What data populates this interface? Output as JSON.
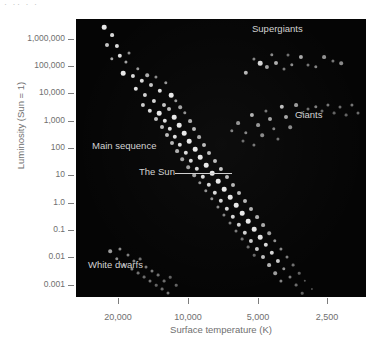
{
  "figure": {
    "top_fragment": "·  ·· ·  ·",
    "background_color": "#ffffff",
    "panel_color": "#050505",
    "star_color": "#e8e8e8",
    "axis_text_color": "#6f6f6f",
    "annotation_text_color": "#d2d2d2"
  },
  "chart_data": {
    "type": "scatter",
    "title": "",
    "xlabel": "Surface temperature (K)",
    "ylabel": "Luminosity (Sun = 1)",
    "grid": false,
    "legend_position": "in-plot annotations",
    "x_scale": "log-reversed",
    "y_scale": "log",
    "xlim": [
      26000,
      2100
    ],
    "ylim": [
      0.0002,
      2000000
    ],
    "xticks": [
      {
        "value": 20000,
        "label": "20,000",
        "px": 118
      },
      {
        "value": 10000,
        "label": "10,000",
        "px": 188
      },
      {
        "value": 5000,
        "label": "5,000",
        "px": 258
      },
      {
        "value": 2500,
        "label": "2,500",
        "px": 327
      }
    ],
    "yticks": [
      {
        "value": 1000000,
        "label": "1,000,000",
        "px": 20
      },
      {
        "value": 100000,
        "label": "100,000",
        "px": 47
      },
      {
        "value": 10000,
        "label": "10,000",
        "px": 74
      },
      {
        "value": 1000,
        "label": "1,000",
        "px": 102
      },
      {
        "value": 100,
        "label": "100",
        "px": 129
      },
      {
        "value": 10,
        "label": "10",
        "px": 156
      },
      {
        "value": 1.0,
        "label": "1.0",
        "px": 184
      },
      {
        "value": 0.1,
        "label": "0.1",
        "px": 211
      },
      {
        "value": 0.01,
        "label": "0.01",
        "px": 238
      },
      {
        "value": 0.001,
        "label": "0.001",
        "px": 266
      }
    ],
    "annotations": [
      {
        "name": "supergiants",
        "text": "Supergiants"
      },
      {
        "name": "giants",
        "text": "Giants"
      },
      {
        "name": "main-sequence",
        "text": "Main sequence"
      },
      {
        "name": "the-sun",
        "text": "The Sun",
        "has_leader_line": true
      },
      {
        "name": "white-dwarfs",
        "text": "White dwarfs"
      }
    ],
    "series": [
      {
        "name": "Main sequence",
        "points": [
          [
            28,
            8,
            4.6,
            1.0
          ],
          [
            36,
            16,
            3.8,
            0.92
          ],
          [
            31,
            26,
            4.0,
            0.85
          ],
          [
            41,
            27,
            4.2,
            0.95
          ],
          [
            44,
            37,
            4.4,
            0.96
          ],
          [
            36,
            40,
            3.4,
            0.72
          ],
          [
            50,
            43,
            3.2,
            0.7
          ],
          [
            53,
            34,
            3.0,
            0.62
          ],
          [
            47,
            54,
            4.6,
            1.0
          ],
          [
            57,
            57,
            4.2,
            0.93
          ],
          [
            62,
            50,
            3.4,
            0.66
          ],
          [
            66,
            62,
            4.4,
            0.95
          ],
          [
            71,
            56,
            3.6,
            0.74
          ],
          [
            60,
            70,
            4.4,
            0.97
          ],
          [
            75,
            66,
            4.0,
            0.85
          ],
          [
            80,
            58,
            3.2,
            0.6
          ],
          [
            69,
            76,
            4.2,
            0.9
          ],
          [
            84,
            72,
            4.4,
            0.97
          ],
          [
            90,
            64,
            3.4,
            0.64
          ],
          [
            78,
            82,
            4.2,
            0.92
          ],
          [
            95,
            76,
            4.6,
            1.0
          ],
          [
            88,
            86,
            4.0,
            0.84
          ],
          [
            100,
            82,
            3.4,
            0.66
          ],
          [
            67,
            86,
            4.2,
            0.88
          ],
          [
            74,
            92,
            4.4,
            0.95
          ],
          [
            83,
            94,
            4.6,
            1.0
          ],
          [
            93,
            90,
            4.0,
            0.8
          ],
          [
            104,
            88,
            3.6,
            0.7
          ],
          [
            98,
            98,
            4.6,
            1.0
          ],
          [
            89,
            102,
            4.4,
            0.96
          ],
          [
            80,
            100,
            4.0,
            0.82
          ],
          [
            109,
            94,
            3.4,
            0.62
          ],
          [
            103,
            106,
            4.6,
            1.0
          ],
          [
            94,
            110,
            4.4,
            0.95
          ],
          [
            86,
            108,
            4.0,
            0.8
          ],
          [
            114,
            102,
            3.8,
            0.74
          ],
          [
            108,
            114,
            4.6,
            1.0
          ],
          [
            99,
            118,
            4.4,
            0.96
          ],
          [
            118,
            110,
            4.0,
            0.8
          ],
          [
            91,
            116,
            4.0,
            0.8
          ],
          [
            113,
            122,
            4.6,
            1.0
          ],
          [
            104,
            126,
            4.4,
            0.95
          ],
          [
            123,
            118,
            3.8,
            0.72
          ],
          [
            96,
            124,
            4.0,
            0.78
          ],
          [
            119,
            130,
            4.6,
            1.0
          ],
          [
            110,
            134,
            4.4,
            0.94
          ],
          [
            128,
            126,
            4.0,
            0.8
          ],
          [
            101,
            132,
            3.8,
            0.74
          ],
          [
            124,
            138,
            4.6,
            1.0
          ],
          [
            115,
            142,
            4.4,
            0.94
          ],
          [
            133,
            134,
            4.0,
            0.8
          ],
          [
            106,
            140,
            3.6,
            0.7
          ],
          [
            130,
            146,
            4.6,
            1.0
          ],
          [
            121,
            150,
            4.4,
            0.93
          ],
          [
            139,
            142,
            4.0,
            0.8
          ],
          [
            112,
            148,
            3.6,
            0.68
          ],
          [
            136,
            154,
            4.6,
            1.0
          ],
          [
            127,
            158,
            4.4,
            0.94
          ],
          [
            145,
            150,
            4.2,
            0.86
          ],
          [
            118,
            156,
            3.6,
            0.7
          ],
          [
            142,
            162,
            4.6,
            1.0
          ],
          [
            133,
            166,
            4.4,
            0.93
          ],
          [
            151,
            158,
            4.0,
            0.8
          ],
          [
            124,
            164,
            3.4,
            0.64
          ],
          [
            148,
            170,
            4.6,
            1.0
          ],
          [
            139,
            174,
            4.4,
            0.94
          ],
          [
            157,
            166,
            4.0,
            0.78
          ],
          [
            130,
            172,
            3.4,
            0.62
          ],
          [
            154,
            178,
            4.6,
            1.0
          ],
          [
            145,
            182,
            4.4,
            0.92
          ],
          [
            163,
            174,
            4.0,
            0.8
          ],
          [
            136,
            180,
            3.4,
            0.62
          ],
          [
            160,
            186,
            4.6,
            1.0
          ],
          [
            151,
            190,
            4.4,
            0.92
          ],
          [
            169,
            182,
            4.0,
            0.78
          ],
          [
            142,
            188,
            3.2,
            0.58
          ],
          [
            166,
            194,
            4.6,
            1.0
          ],
          [
            157,
            198,
            4.4,
            0.92
          ],
          [
            175,
            190,
            4.0,
            0.76
          ],
          [
            148,
            196,
            3.2,
            0.56
          ],
          [
            172,
            202,
            4.6,
            1.0
          ],
          [
            163,
            206,
            4.4,
            0.9
          ],
          [
            181,
            198,
            3.8,
            0.74
          ],
          [
            154,
            204,
            3.0,
            0.54
          ],
          [
            178,
            210,
            4.6,
            0.98
          ],
          [
            169,
            214,
            4.4,
            0.9
          ],
          [
            187,
            206,
            3.8,
            0.72
          ],
          [
            160,
            212,
            3.0,
            0.52
          ],
          [
            184,
            218,
            4.6,
            0.98
          ],
          [
            175,
            222,
            4.2,
            0.88
          ],
          [
            193,
            214,
            3.6,
            0.68
          ],
          [
            166,
            220,
            2.8,
            0.48
          ],
          [
            190,
            226,
            4.4,
            0.94
          ],
          [
            181,
            230,
            4.2,
            0.86
          ],
          [
            199,
            222,
            3.4,
            0.62
          ],
          [
            172,
            228,
            2.8,
            0.46
          ],
          [
            196,
            234,
            4.4,
            0.92
          ],
          [
            187,
            238,
            4.0,
            0.82
          ],
          [
            205,
            230,
            3.2,
            0.58
          ],
          [
            178,
            236,
            2.6,
            0.44
          ],
          [
            202,
            242,
            4.2,
            0.88
          ],
          [
            193,
            246,
            3.8,
            0.76
          ],
          [
            211,
            238,
            3.0,
            0.54
          ],
          [
            199,
            254,
            3.6,
            0.68
          ],
          [
            208,
            250,
            3.4,
            0.62
          ],
          [
            217,
            246,
            2.8,
            0.48
          ],
          [
            214,
            258,
            3.0,
            0.52
          ],
          [
            205,
            262,
            3.2,
            0.56
          ],
          [
            223,
            254,
            2.6,
            0.42
          ],
          [
            220,
            266,
            2.8,
            0.46
          ],
          [
            229,
            262,
            2.4,
            0.38
          ],
          [
            226,
            274,
            2.6,
            0.4
          ],
          [
            236,
            270,
            2.2,
            0.34
          ],
          [
            233,
            280,
            2.4,
            0.36
          ]
        ]
      },
      {
        "name": "Supergiants",
        "points": [
          [
            170,
            54,
            4.4,
            0.78
          ],
          [
            184,
            44,
            4.6,
            0.92
          ],
          [
            191,
            48,
            4.2,
            0.7
          ],
          [
            200,
            44,
            4.0,
            0.74
          ],
          [
            208,
            50,
            3.0,
            0.52
          ],
          [
            216,
            46,
            3.4,
            0.6
          ],
          [
            225,
            38,
            4.2,
            0.72
          ],
          [
            232,
            46,
            3.0,
            0.5
          ],
          [
            240,
            48,
            3.4,
            0.56
          ],
          [
            248,
            38,
            3.8,
            0.62
          ],
          [
            257,
            42,
            3.2,
            0.5
          ],
          [
            265,
            44,
            3.6,
            0.58
          ],
          [
            178,
            40,
            3.2,
            0.56
          ],
          [
            196,
            36,
            3.4,
            0.58
          ],
          [
            212,
            36,
            3.0,
            0.48
          ]
        ]
      },
      {
        "name": "Giants",
        "points": [
          [
            162,
            104,
            3.8,
            0.62
          ],
          [
            170,
            114,
            3.4,
            0.56
          ],
          [
            176,
            96,
            4.2,
            0.76
          ],
          [
            182,
            106,
            3.8,
            0.64
          ],
          [
            186,
            116,
            3.6,
            0.58
          ],
          [
            190,
            92,
            3.2,
            0.5
          ],
          [
            194,
            100,
            4.0,
            0.7
          ],
          [
            198,
            110,
            3.4,
            0.54
          ],
          [
            202,
            120,
            3.2,
            0.48
          ],
          [
            206,
            88,
            4.4,
            0.82
          ],
          [
            210,
            98,
            4.0,
            0.72
          ],
          [
            214,
            108,
            3.6,
            0.58
          ],
          [
            220,
            86,
            3.8,
            0.66
          ],
          [
            226,
            94,
            3.2,
            0.5
          ],
          [
            232,
            90,
            3.0,
            0.46
          ],
          [
            240,
            88,
            3.4,
            0.54
          ],
          [
            246,
            92,
            3.0,
            0.46
          ],
          [
            252,
            86,
            3.2,
            0.5
          ],
          [
            258,
            94,
            2.8,
            0.42
          ],
          [
            264,
            88,
            3.0,
            0.46
          ],
          [
            270,
            96,
            2.8,
            0.42
          ],
          [
            276,
            86,
            3.2,
            0.5
          ],
          [
            282,
            94,
            3.0,
            0.46
          ],
          [
            167,
            122,
            3.0,
            0.46
          ],
          [
            178,
            126,
            3.2,
            0.5
          ],
          [
            156,
            112,
            3.4,
            0.54
          ]
        ]
      },
      {
        "name": "White dwarfs",
        "points": [
          [
            34,
            232,
            3.6,
            0.66
          ],
          [
            44,
            230,
            3.2,
            0.58
          ],
          [
            52,
            236,
            3.0,
            0.54
          ],
          [
            41,
            240,
            3.4,
            0.6
          ],
          [
            58,
            242,
            3.2,
            0.56
          ],
          [
            48,
            246,
            3.0,
            0.52
          ],
          [
            64,
            240,
            2.8,
            0.48
          ],
          [
            56,
            250,
            3.2,
            0.56
          ],
          [
            70,
            248,
            3.0,
            0.52
          ],
          [
            62,
            254,
            2.8,
            0.48
          ],
          [
            76,
            252,
            3.0,
            0.52
          ],
          [
            68,
            258,
            2.8,
            0.46
          ],
          [
            82,
            256,
            2.8,
            0.48
          ],
          [
            74,
            262,
            3.0,
            0.5
          ],
          [
            88,
            262,
            2.8,
            0.46
          ],
          [
            80,
            266,
            2.6,
            0.42
          ],
          [
            94,
            258,
            2.6,
            0.42
          ],
          [
            86,
            270,
            2.8,
            0.46
          ],
          [
            100,
            266,
            2.6,
            0.42
          ],
          [
            92,
            274,
            3.0,
            0.5
          ]
        ]
      }
    ]
  }
}
